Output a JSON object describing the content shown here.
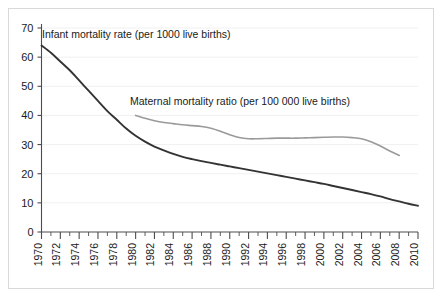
{
  "figure": {
    "background_color": "#ffffff",
    "border_color": "#d9d9d9"
  },
  "chart_data": {
    "type": "line",
    "title": "",
    "subtitle": "",
    "xlabel": "",
    "ylabel": "",
    "xlim": [
      1970,
      2010
    ],
    "ylim": [
      0,
      70
    ],
    "grid": true,
    "grid_axis": "y",
    "legend_position": "inline-annotation",
    "y_ticks": [
      0,
      10,
      20,
      30,
      40,
      50,
      60,
      70
    ],
    "y_tick_labels": [
      "0",
      "10",
      "20",
      "30",
      "40",
      "50",
      "60",
      "70"
    ],
    "x_ticks": [
      1970,
      1972,
      1974,
      1976,
      1978,
      1980,
      1982,
      1984,
      1986,
      1988,
      1990,
      1992,
      1994,
      1996,
      1998,
      2000,
      2002,
      2004,
      2006,
      2008,
      2010
    ],
    "x_tick_labels": [
      "1970",
      "1972",
      "1974",
      "1976",
      "1978",
      "1980",
      "1982",
      "1984",
      "1986",
      "1988",
      "1990",
      "1992",
      "1994",
      "1996",
      "1998",
      "2000",
      "2002",
      "2004",
      "2006",
      "2008",
      "2010"
    ],
    "x_minor_tick_step": 1,
    "series": [
      {
        "name": "Infant mortality rate (per 1000 live births)",
        "label": "Infant mortality rate (per 1000 live births)",
        "color": "#333333",
        "x": [
          1970,
          1971,
          1972,
          1973,
          1974,
          1975,
          1976,
          1977,
          1978,
          1979,
          1980,
          1981,
          1982,
          1983,
          1984,
          1985,
          1986,
          1987,
          1988,
          1989,
          1990,
          1991,
          1992,
          1993,
          1994,
          1995,
          1996,
          1997,
          1998,
          1999,
          2000,
          2001,
          2002,
          2003,
          2004,
          2005,
          2006,
          2007,
          2008,
          2009,
          2010
        ],
        "values": [
          64.0,
          61.5,
          58.5,
          55.5,
          52.0,
          48.5,
          45.0,
          41.5,
          38.5,
          35.5,
          33.0,
          31.0,
          29.3,
          28.0,
          26.8,
          25.8,
          25.0,
          24.3,
          23.7,
          23.1,
          22.5,
          21.9,
          21.3,
          20.7,
          20.1,
          19.5,
          18.9,
          18.3,
          17.7,
          17.1,
          16.5,
          15.8,
          15.1,
          14.4,
          13.7,
          13.0,
          12.2,
          11.3,
          10.5,
          9.7,
          9.0
        ],
        "annotation": {
          "text": "Infant mortality rate (per 1000 live births)",
          "x_px": 42,
          "y_px": 38
        }
      },
      {
        "name": "Maternal mortality ratio (per 100 000 live births)",
        "label": "Maternal mortality ratio (per 100 000 live births)",
        "color": "#9a9a9a",
        "x": [
          1980,
          1981,
          1982,
          1983,
          1984,
          1985,
          1986,
          1987,
          1988,
          1989,
          1990,
          1991,
          1992,
          1993,
          1994,
          1995,
          1996,
          1997,
          1998,
          1999,
          2000,
          2001,
          2002,
          2003,
          2004,
          2005,
          2006,
          2007,
          2008
        ],
        "values": [
          40.0,
          39.0,
          38.2,
          37.6,
          37.2,
          36.8,
          36.5,
          36.2,
          35.6,
          34.6,
          33.4,
          32.4,
          32.0,
          32.0,
          32.1,
          32.2,
          32.2,
          32.2,
          32.3,
          32.4,
          32.5,
          32.6,
          32.6,
          32.4,
          32.0,
          31.0,
          29.5,
          27.8,
          26.3
        ],
        "annotation": {
          "text": "Maternal mortality ratio (per 100 000 live births)",
          "x_px": 130,
          "y_px": 105
        }
      }
    ]
  }
}
